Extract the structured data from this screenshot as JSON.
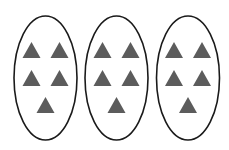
{
  "diagram": {
    "groups": [
      {
        "label": "group-1",
        "count": 5
      },
      {
        "label": "group-2",
        "count": 5
      },
      {
        "label": "group-3",
        "count": 5
      }
    ],
    "total_items": 15,
    "item_shape": "triangle",
    "colors": {
      "background": "#ffffff",
      "ellipse_stroke": "#1a1a1a",
      "triangle_fill": "#5c5c5c"
    }
  }
}
